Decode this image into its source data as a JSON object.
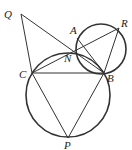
{
  "diagram": {
    "points": {
      "Q": {
        "label": "Q",
        "x": 21,
        "y": 14,
        "lx": 4,
        "ly": 18
      },
      "A": {
        "label": "A",
        "x": 77,
        "y": 38,
        "lx": 70,
        "ly": 34
      },
      "R": {
        "label": "R",
        "x": 119,
        "y": 28,
        "lx": 121,
        "ly": 27
      },
      "N": {
        "label": "N",
        "x": 76,
        "y": 57,
        "lx": 64,
        "ly": 62
      },
      "C": {
        "label": "C",
        "x": 32,
        "y": 73,
        "lx": 19,
        "ly": 78
      },
      "B": {
        "label": "B",
        "x": 104,
        "y": 73,
        "lx": 107,
        "ly": 82
      },
      "P": {
        "label": "P",
        "x": 68,
        "y": 138,
        "lx": 64,
        "ly": 149
      }
    },
    "circles": [
      {
        "name": "circle-CBP",
        "cx": 68,
        "cy": 95,
        "r": 42
      },
      {
        "name": "circle-ABR",
        "cx": 101,
        "cy": 49,
        "r": 25
      }
    ],
    "segments": [
      "Q-C",
      "Q-B",
      "C-R",
      "C-B",
      "C-P",
      "B-P",
      "R-B",
      "A-B"
    ],
    "stroke_color": "#333333"
  }
}
